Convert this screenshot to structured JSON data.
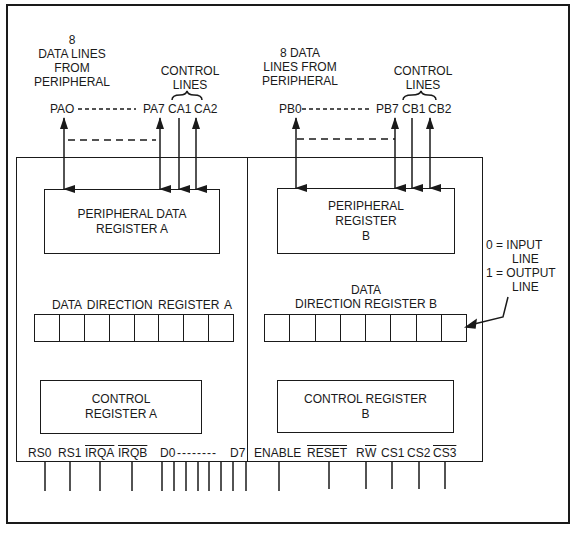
{
  "diagram": {
    "type": "PIA block diagram (6821-style peripheral interface adapter)",
    "port_a": {
      "data_lines_label": [
        "8",
        "DATA LINES",
        "FROM",
        "PERIPHERAL"
      ],
      "control_lines_label": [
        "CONTROL",
        "LINES"
      ],
      "pins": {
        "first": "PAO",
        "last": "PA7",
        "ctrl1": "CA1",
        "ctrl2": "CA2"
      },
      "peripheral_register": [
        "PERIPHERAL DATA",
        "REGISTER A"
      ],
      "data_direction_register": "DATA  DIRECTION  REGISTER  A",
      "ddr_bits": 8,
      "control_register": [
        "CONTROL",
        "REGISTER A"
      ]
    },
    "port_b": {
      "data_lines_label": [
        "8 DATA",
        "LINES FROM",
        "PERIPHERAL"
      ],
      "control_lines_label": [
        "CONTROL",
        "LINES"
      ],
      "pins": {
        "first": "PB0",
        "last": "PB7",
        "ctrl1": "CB1",
        "ctrl2": "CB2"
      },
      "peripheral_register": [
        "PERIPHERAL",
        "REGISTER",
        "B"
      ],
      "data_direction_register": [
        "DATA",
        "DIRECTION REGISTER B"
      ],
      "ddr_bits": 8,
      "control_register": [
        "CONTROL REGISTER",
        "B"
      ]
    },
    "legend": {
      "line1": "0 = INPUT",
      "line2": "LINE",
      "line3": "1 = OUTPUT",
      "line4": "LINE"
    },
    "bottom_pins": {
      "rs0": "RS0",
      "rs1": "RS1",
      "irqa": "IRQA",
      "irqb": "IRQB",
      "d0": "D0",
      "dash": "--------",
      "d7": "D7",
      "enable": "ENABLE",
      "reset": "RESET",
      "r": "R",
      "w": "W",
      "cs1": "CS1",
      "cs2": "CS2",
      "cs3": "CS3"
    },
    "colors": {
      "ink": "#1a1a1a",
      "paper": "#ffffff"
    }
  }
}
